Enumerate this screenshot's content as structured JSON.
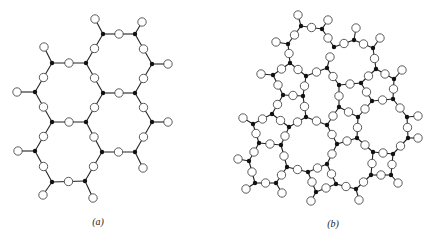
{
  "figure": {
    "panels": [
      {
        "id": "a",
        "caption": "(a)",
        "caption_pos": [
          98,
          216
        ],
        "description": "Crystalline hexagonal network: black Si nodes bridged by white O circles",
        "si_nodes": [
          [
            103,
            34
          ],
          [
            135,
            34
          ],
          [
            52,
            63
          ],
          [
            86,
            63
          ],
          [
            152,
            64
          ],
          [
            35,
            92
          ],
          [
            103,
            93
          ],
          [
            135,
            93
          ],
          [
            52,
            122
          ],
          [
            86,
            122
          ],
          [
            152,
            122
          ],
          [
            35,
            151
          ],
          [
            102,
            152
          ],
          [
            135,
            152
          ],
          [
            52,
            182
          ],
          [
            85,
            181
          ]
        ],
        "bridges": [
          [
            0,
            1
          ],
          [
            0,
            3
          ],
          [
            1,
            4
          ],
          [
            2,
            3
          ],
          [
            2,
            5
          ],
          [
            3,
            6
          ],
          [
            4,
            7
          ],
          [
            5,
            8
          ],
          [
            6,
            7
          ],
          [
            6,
            9
          ],
          [
            7,
            10
          ],
          [
            8,
            9
          ],
          [
            8,
            11
          ],
          [
            9,
            12
          ],
          [
            10,
            13
          ],
          [
            11,
            14
          ],
          [
            12,
            13
          ],
          [
            12,
            15
          ],
          [
            14,
            15
          ]
        ],
        "terminals": [
          [
            0,
            [
              95,
              19
            ]
          ],
          [
            1,
            [
              142,
              22
            ]
          ],
          [
            2,
            [
              44,
              47
            ]
          ],
          [
            4,
            [
              168,
              64
            ]
          ],
          [
            5,
            [
              17,
              92
            ]
          ],
          [
            10,
            [
              168,
              122
            ]
          ],
          [
            11,
            [
              18,
              151
            ]
          ],
          [
            13,
            [
              143,
              168
            ]
          ],
          [
            14,
            [
              43,
              195
            ]
          ],
          [
            15,
            [
              93,
              198
            ]
          ]
        ]
      },
      {
        "id": "b",
        "caption": "(b)",
        "caption_pos": [
          333,
          218
        ],
        "description": "Random (glassy) network: black Si nodes bridged by white O circles",
        "si_nodes": [
          [
            301,
            26
          ],
          [
            322,
            29
          ],
          [
            288,
            44
          ],
          [
            290,
            63
          ],
          [
            273,
            75
          ],
          [
            306,
            76
          ],
          [
            327,
            68
          ],
          [
            334,
            47
          ],
          [
            354,
            40
          ],
          [
            373,
            48
          ],
          [
            376,
            69
          ],
          [
            394,
            79
          ],
          [
            339,
            85
          ],
          [
            361,
            83
          ],
          [
            283,
            95
          ],
          [
            303,
            96
          ],
          [
            272,
            114
          ],
          [
            289,
            127
          ],
          [
            306,
            117
          ],
          [
            327,
            125
          ],
          [
            339,
            107
          ],
          [
            358,
            117
          ],
          [
            372,
            101
          ],
          [
            393,
            99
          ],
          [
            407,
            117
          ],
          [
            408,
            138
          ],
          [
            393,
            154
          ],
          [
            373,
            152
          ],
          [
            357,
            138
          ],
          [
            337,
            144
          ],
          [
            253,
            124
          ],
          [
            259,
            143
          ],
          [
            281,
            145
          ],
          [
            249,
            161
          ],
          [
            255,
            183
          ],
          [
            276,
            183
          ],
          [
            287,
            167
          ],
          [
            308,
            172
          ],
          [
            327,
            164
          ],
          [
            316,
            192
          ],
          [
            336,
            184
          ],
          [
            356,
            189
          ],
          [
            371,
            175
          ],
          [
            391,
            175
          ]
        ],
        "bridges": [
          [
            0,
            1
          ],
          [
            0,
            2
          ],
          [
            1,
            7
          ],
          [
            2,
            3
          ],
          [
            3,
            4
          ],
          [
            3,
            5
          ],
          [
            4,
            14
          ],
          [
            5,
            6
          ],
          [
            5,
            15
          ],
          [
            6,
            12
          ],
          [
            7,
            8
          ],
          [
            8,
            9
          ],
          [
            9,
            10
          ],
          [
            10,
            11
          ],
          [
            10,
            13
          ],
          [
            11,
            23
          ],
          [
            12,
            13
          ],
          [
            12,
            20
          ],
          [
            13,
            22
          ],
          [
            14,
            15
          ],
          [
            14,
            16
          ],
          [
            15,
            18
          ],
          [
            16,
            17
          ],
          [
            16,
            30
          ],
          [
            17,
            18
          ],
          [
            17,
            32
          ],
          [
            18,
            19
          ],
          [
            19,
            20
          ],
          [
            19,
            29
          ],
          [
            20,
            21
          ],
          [
            21,
            22
          ],
          [
            21,
            28
          ],
          [
            22,
            23
          ],
          [
            23,
            24
          ],
          [
            24,
            25
          ],
          [
            25,
            26
          ],
          [
            26,
            27
          ],
          [
            26,
            43
          ],
          [
            27,
            28
          ],
          [
            27,
            42
          ],
          [
            28,
            29
          ],
          [
            29,
            38
          ],
          [
            30,
            31
          ],
          [
            31,
            32
          ],
          [
            31,
            33
          ],
          [
            32,
            36
          ],
          [
            33,
            34
          ],
          [
            34,
            35
          ],
          [
            35,
            36
          ],
          [
            36,
            37
          ],
          [
            37,
            38
          ],
          [
            37,
            39
          ],
          [
            38,
            40
          ],
          [
            39,
            40
          ],
          [
            40,
            41
          ],
          [
            41,
            42
          ],
          [
            42,
            43
          ]
        ],
        "terminals": [
          [
            0,
            [
              298,
              15
            ]
          ],
          [
            1,
            [
              328,
              20
            ]
          ],
          [
            2,
            [
              276,
              42
            ]
          ],
          [
            4,
            [
              261,
              74
            ]
          ],
          [
            6,
            [
              330,
              57
            ]
          ],
          [
            8,
            [
              356,
              28
            ]
          ],
          [
            9,
            [
              380,
              38
            ]
          ],
          [
            11,
            [
              402,
              70
            ]
          ],
          [
            24,
            [
              418,
              116
            ]
          ],
          [
            25,
            [
              418,
              138
            ]
          ],
          [
            30,
            [
              243,
              118
            ]
          ],
          [
            33,
            [
              238,
              159
            ]
          ],
          [
            34,
            [
              246,
              189
            ]
          ],
          [
            35,
            [
              282,
              193
            ]
          ],
          [
            39,
            [
              311,
              201
            ]
          ],
          [
            41,
            [
              359,
              200
            ]
          ],
          [
            43,
            [
              398,
              183
            ]
          ]
        ]
      }
    ],
    "style": {
      "bond_color": "#222222",
      "si_color": "#111111",
      "o_fill": "#ffffff",
      "o_stroke": "#333333",
      "o_radius": 4.2,
      "si_radius": 2.2
    }
  }
}
